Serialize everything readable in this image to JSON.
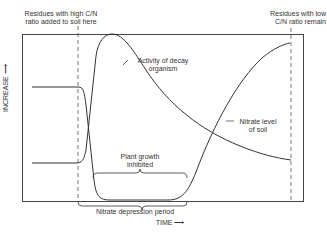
{
  "diagram": {
    "title": "",
    "y_axis_label": "INCREASE",
    "x_axis_label": "TIME",
    "annotations": {
      "high_cn": [
        "Residues with high C/N",
        "ratio added to soil here"
      ],
      "low_cn": [
        "Residues with low",
        "C/N ratio remain"
      ],
      "decay": [
        "Activity of decay",
        "organism"
      ],
      "nitrate": [
        "Nitrate level",
        "of soil"
      ],
      "plant": [
        "Plant growth",
        "inhibited"
      ],
      "depression": "Nitrate depression period"
    },
    "curves": [
      {
        "name": "Activity of decay organism",
        "color": "#333333"
      },
      {
        "name": "Nitrate level of soil",
        "color": "#333333"
      }
    ],
    "colors": {
      "line": "#333333",
      "background": "#ffffff"
    }
  }
}
